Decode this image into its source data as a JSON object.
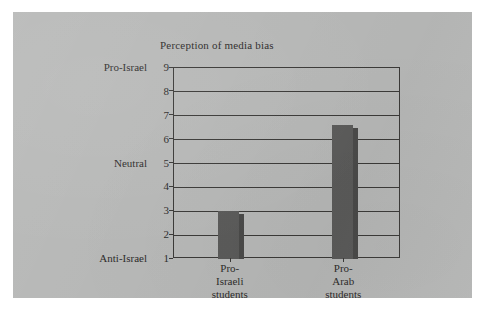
{
  "chart_data": {
    "type": "bar",
    "title": "Perception of media bias",
    "xlabel": "",
    "ylabel": "",
    "categories": [
      "Pro-Israeli students",
      "Pro-Arab students"
    ],
    "category_lines": [
      [
        "Pro-",
        "Israeli",
        "students"
      ],
      [
        "Pro-",
        "Arab",
        "students"
      ]
    ],
    "values": [
      3.0,
      6.6
    ],
    "ylim": [
      1,
      9
    ],
    "yticks": [
      1,
      2,
      3,
      4,
      5,
      6,
      7,
      8,
      9
    ],
    "ytick_labels": [
      "1",
      "2",
      "3",
      "4",
      "5",
      "6",
      "7",
      "8",
      "9"
    ],
    "y_category_labels": [
      {
        "label": "Pro-Israel",
        "value": 9
      },
      {
        "label": "Neutral",
        "value": 5
      },
      {
        "label": "Anti-Israel",
        "value": 1
      }
    ],
    "grid": true,
    "legend": false,
    "legend_position": "none",
    "bar_color": "#5b5b5a",
    "plot_background": "#b7b8b7",
    "axis_color": "#3b3a38",
    "text_color": "#2e2c2b"
  },
  "figure": {
    "page_background": "#ffffff",
    "panel_background": "#b7b8b7"
  }
}
